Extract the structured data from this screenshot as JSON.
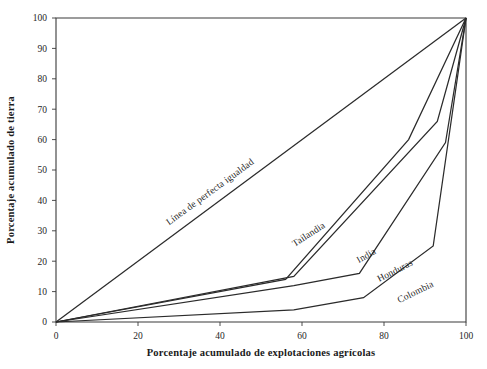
{
  "chart_data": {
    "type": "line",
    "title": "",
    "subtitle": "",
    "xlabel": "Porcentaje acumulado de explotaciones agrícolas",
    "ylabel": "Porcentaje acumulado de tierra",
    "xlim": [
      0,
      100
    ],
    "ylim": [
      0,
      100
    ],
    "xticks": [
      0,
      20,
      40,
      60,
      80,
      100
    ],
    "yticks": [
      0,
      10,
      20,
      30,
      40,
      50,
      60,
      70,
      80,
      90,
      100
    ],
    "xtick_labels": [
      "0",
      "20",
      "40",
      "60",
      "80",
      "100"
    ],
    "ytick_labels": [
      "0",
      "10",
      "20",
      "30",
      "40",
      "50",
      "60",
      "70",
      "80",
      "90",
      "100"
    ],
    "grid": false,
    "legend_position": "inline-labels",
    "series": [
      {
        "name": "Línea de perfecta igualdad",
        "label_angle": -36,
        "label_x": 38,
        "label_y": 42,
        "x": [
          0,
          100
        ],
        "y": [
          0,
          100
        ]
      },
      {
        "name": "Tailandia",
        "label_angle": -33,
        "label_x": 62,
        "label_y": 28,
        "x": [
          0,
          56,
          86,
          100
        ],
        "y": [
          0,
          14,
          60,
          100
        ]
      },
      {
        "name": "India",
        "label_angle": -30,
        "label_x": 76,
        "label_y": 21,
        "x": [
          0,
          58,
          93,
          100
        ],
        "y": [
          0,
          15,
          66,
          100
        ]
      },
      {
        "name": "Honduras",
        "label_angle": -27,
        "label_x": 83,
        "label_y": 16,
        "x": [
          0,
          58,
          74,
          95,
          100
        ],
        "y": [
          0,
          12,
          16,
          59,
          100
        ]
      },
      {
        "name": "Colombia",
        "label_angle": -26,
        "label_x": 88,
        "label_y": 9,
        "x": [
          0,
          58,
          75,
          92,
          100
        ],
        "y": [
          0,
          4,
          8,
          25,
          100
        ]
      }
    ]
  },
  "figure": {
    "axis_color": "#3a3a3a",
    "curve_color": "#2b2b2b",
    "background": "#ffffff"
  }
}
